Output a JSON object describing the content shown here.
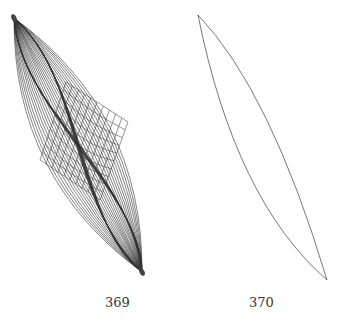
{
  "figures": [
    {
      "label": "369",
      "description": "spindle-shaped mesh overlapping a distorted square grid"
    },
    {
      "label": "370",
      "description": "thin lens-shaped outline"
    }
  ],
  "colors": {
    "stroke": "#333333",
    "grid": "#555555",
    "background": "#ffffff"
  }
}
